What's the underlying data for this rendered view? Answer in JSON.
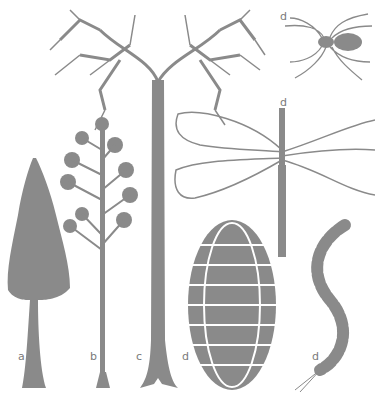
{
  "figure": {
    "subjects": [
      {
        "id": "a",
        "label": "a",
        "description": "conifer-like tree"
      },
      {
        "id": "b",
        "label": "b",
        "description": "slender tree with tufted foliage"
      },
      {
        "id": "c",
        "label": "c",
        "description": "tall tree with branching crown"
      },
      {
        "id": "d_spider",
        "label": "d",
        "description": "spider"
      },
      {
        "id": "d_dragonfly",
        "label": "d",
        "description": "giant dragonfly"
      },
      {
        "id": "d_arthropleura",
        "label": "d",
        "description": "segmented oval arthropod"
      },
      {
        "id": "d_centipede",
        "label": "d",
        "description": "centipede"
      }
    ],
    "colors": {
      "ink": "#8a8a8a",
      "background": "#ffffff"
    }
  }
}
